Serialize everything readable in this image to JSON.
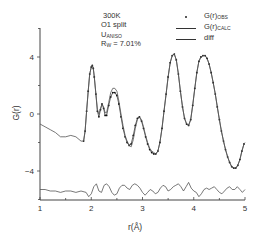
{
  "chart_data": {
    "type": "line",
    "title": "",
    "xlabel": "r(Å)",
    "ylabel": "G(r)",
    "xlim": [
      1,
      5
    ],
    "ylim": [
      -6.2,
      6.0
    ],
    "xticks": [
      1,
      2,
      3,
      4,
      5
    ],
    "yticks": [
      -4,
      0,
      4
    ],
    "grid": false,
    "legend_position": "upper right",
    "annotation": {
      "line1": "300K",
      "line2": "O1 split",
      "line3_main": "U",
      "line3_sub": "ANISO",
      "line4_main": "R",
      "line4_sub": "W",
      "line4_value": " = 7.01%"
    },
    "legend": [
      {
        "main": "G(r)",
        "sub": "OBS",
        "style": "dots"
      },
      {
        "main": "G(r)",
        "sub": "CALC",
        "style": "line"
      },
      {
        "main": "diff",
        "sub": "",
        "style": "line"
      }
    ],
    "series": [
      {
        "name": "G(r)_OBS",
        "style": "dots",
        "x": [
          1.85,
          1.88,
          1.91,
          1.94,
          1.97,
          2.0,
          2.02,
          2.04,
          2.06,
          2.09,
          2.12,
          2.15,
          2.18,
          2.21,
          2.24,
          2.27,
          2.3,
          2.34,
          2.38,
          2.42,
          2.46,
          2.5,
          2.54,
          2.58,
          2.62,
          2.66,
          2.7,
          2.74,
          2.78,
          2.82,
          2.86,
          2.9,
          2.94,
          2.98,
          3.02,
          3.06,
          3.1,
          3.14,
          3.18,
          3.22,
          3.26,
          3.3,
          3.34,
          3.38,
          3.42,
          3.46,
          3.5,
          3.54,
          3.58,
          3.62,
          3.66,
          3.7,
          3.74,
          3.78,
          3.82,
          3.86,
          3.9,
          3.94,
          3.98,
          4.02,
          4.06,
          4.1,
          4.14,
          4.18,
          4.22,
          4.26,
          4.3,
          4.34,
          4.38,
          4.42,
          4.46,
          4.5,
          4.54,
          4.58,
          4.62,
          4.66,
          4.7,
          4.74,
          4.78,
          4.82,
          4.86,
          4.9,
          4.94,
          4.98
        ],
        "y": [
          -1.9,
          -1.2,
          0.2,
          1.6,
          2.8,
          3.3,
          3.4,
          3.2,
          2.6,
          1.4,
          0.2,
          -0.2,
          0.3,
          0.7,
          0.4,
          -0.1,
          -0.1,
          0.6,
          1.2,
          1.5,
          1.5,
          1.3,
          0.7,
          -0.2,
          -1.0,
          -1.6,
          -2.0,
          -2.2,
          -2.1,
          -1.5,
          -0.8,
          -0.3,
          -0.2,
          -0.5,
          -1.0,
          -1.6,
          -2.1,
          -2.5,
          -2.7,
          -2.8,
          -2.8,
          -2.6,
          -2.0,
          -1.0,
          0.2,
          1.4,
          2.6,
          3.6,
          4.1,
          4.2,
          3.8,
          2.8,
          1.6,
          0.5,
          -0.3,
          -0.7,
          -0.8,
          -0.4,
          0.6,
          1.8,
          2.9,
          3.7,
          4.0,
          4.1,
          4.1,
          3.9,
          3.5,
          2.9,
          2.2,
          1.4,
          0.5,
          -0.4,
          -1.2,
          -1.9,
          -2.5,
          -3.0,
          -3.4,
          -3.7,
          -3.8,
          -3.8,
          -3.6,
          -3.2,
          -2.6,
          -2.1
        ]
      },
      {
        "name": "G(r)_CALC",
        "style": "line",
        "x": [
          1.0,
          1.1,
          1.2,
          1.3,
          1.4,
          1.5,
          1.6,
          1.7,
          1.8,
          1.85,
          1.88,
          1.91,
          1.94,
          1.97,
          2.0,
          2.02,
          2.04,
          2.06,
          2.09,
          2.12,
          2.15,
          2.18,
          2.21,
          2.24,
          2.27,
          2.3,
          2.34,
          2.38,
          2.42,
          2.46,
          2.5,
          2.54,
          2.58,
          2.62,
          2.66,
          2.7,
          2.74,
          2.78,
          2.82,
          2.86,
          2.9,
          2.94,
          2.98,
          3.02,
          3.06,
          3.1,
          3.14,
          3.18,
          3.22,
          3.26,
          3.3,
          3.34,
          3.38,
          3.42,
          3.46,
          3.5,
          3.54,
          3.58,
          3.62,
          3.66,
          3.7,
          3.74,
          3.78,
          3.82,
          3.86,
          3.9,
          3.94,
          3.98,
          4.02,
          4.06,
          4.1,
          4.14,
          4.18,
          4.22,
          4.26,
          4.3,
          4.34,
          4.38,
          4.42,
          4.46,
          4.5,
          4.54,
          4.58,
          4.62,
          4.66,
          4.7,
          4.74,
          4.78,
          4.82,
          4.86,
          4.9,
          4.94,
          4.98,
          5.0
        ],
        "y": [
          -0.7,
          -0.9,
          -1.1,
          -1.3,
          -1.6,
          -1.6,
          -1.5,
          -1.6,
          -1.9,
          -1.9,
          -1.2,
          0.2,
          1.6,
          2.8,
          3.3,
          3.4,
          3.2,
          2.6,
          1.4,
          0.3,
          0.0,
          0.4,
          0.7,
          0.5,
          0.1,
          0.1,
          0.8,
          1.5,
          1.8,
          1.8,
          1.6,
          0.9,
          0.0,
          -0.8,
          -1.5,
          -1.9,
          -2.2,
          -2.3,
          -1.8,
          -1.0,
          -0.4,
          -0.2,
          -0.4,
          -0.9,
          -1.5,
          -2.0,
          -2.4,
          -2.6,
          -2.7,
          -2.8,
          -2.6,
          -2.0,
          -1.0,
          0.2,
          1.4,
          2.6,
          3.6,
          4.1,
          4.2,
          3.8,
          2.8,
          1.6,
          0.5,
          -0.3,
          -0.7,
          -0.8,
          -0.4,
          0.6,
          1.8,
          2.9,
          3.7,
          4.0,
          4.1,
          4.1,
          3.9,
          3.5,
          2.9,
          2.2,
          1.4,
          0.5,
          -0.4,
          -1.2,
          -1.9,
          -2.5,
          -3.0,
          -3.4,
          -3.7,
          -3.8,
          -3.8,
          -3.6,
          -3.2,
          -2.6,
          -2.1,
          -2.0
        ]
      },
      {
        "name": "diff",
        "style": "line",
        "x": [
          1.0,
          1.1,
          1.2,
          1.3,
          1.4,
          1.5,
          1.6,
          1.7,
          1.8,
          1.9,
          1.95,
          2.0,
          2.05,
          2.1,
          2.15,
          2.2,
          2.25,
          2.3,
          2.35,
          2.4,
          2.45,
          2.5,
          2.55,
          2.6,
          2.65,
          2.7,
          2.75,
          2.8,
          2.85,
          2.9,
          2.95,
          3.0,
          3.05,
          3.1,
          3.15,
          3.2,
          3.25,
          3.3,
          3.35,
          3.4,
          3.45,
          3.5,
          3.55,
          3.6,
          3.65,
          3.7,
          3.75,
          3.8,
          3.85,
          3.9,
          3.95,
          4.0,
          4.05,
          4.1,
          4.15,
          4.2,
          4.25,
          4.3,
          4.35,
          4.4,
          4.45,
          4.5,
          4.55,
          4.6,
          4.65,
          4.7,
          4.75,
          4.8,
          4.85,
          4.9,
          4.95,
          5.0
        ],
        "y": [
          -5.3,
          -5.3,
          -5.4,
          -5.4,
          -5.5,
          -5.4,
          -5.4,
          -5.5,
          -5.4,
          -5.5,
          -5.8,
          -5.6,
          -5.1,
          -4.9,
          -5.4,
          -5.5,
          -5.0,
          -4.9,
          -5.1,
          -5.5,
          -5.7,
          -5.6,
          -5.2,
          -5.0,
          -5.0,
          -5.2,
          -5.3,
          -5.0,
          -4.9,
          -5.0,
          -5.2,
          -5.5,
          -5.7,
          -5.5,
          -5.3,
          -5.4,
          -5.6,
          -5.5,
          -5.2,
          -5.0,
          -5.1,
          -5.4,
          -5.3,
          -5.1,
          -5.0,
          -4.9,
          -5.1,
          -5.4,
          -5.1,
          -4.8,
          -5.2,
          -5.4,
          -5.5,
          -5.8,
          -5.6,
          -5.3,
          -5.2,
          -5.3,
          -5.2,
          -5.1,
          -5.3,
          -5.5,
          -5.6,
          -5.4,
          -5.2,
          -5.1,
          -5.3,
          -5.3,
          -5.1,
          -5.3,
          -5.5,
          -5.3
        ]
      }
    ]
  }
}
